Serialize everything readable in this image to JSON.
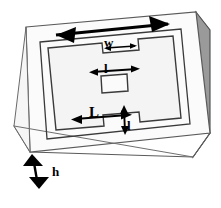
{
  "figure": {
    "kind": "technical-diagram",
    "projection": "oblique-3d",
    "colors": {
      "outline": "#333333",
      "top_face": "#fafafa",
      "front_face": "#ffffff",
      "side_face": "#9a9a9a",
      "slot_fill": "#f2f2f2",
      "arrow": "#000000",
      "label_text": "#000000",
      "background": "#ffffff"
    },
    "dimensions": [
      {
        "id": "w-top-notch",
        "label": "w",
        "arrow": "double-headed-horizontal",
        "location": "top notch of slot ring",
        "describes": "width of the upper notch"
      },
      {
        "id": "l-center-patch",
        "label": "l",
        "arrow": "double-headed-horizontal",
        "location": "above centre square patch",
        "describes": "side length of the centre square"
      },
      {
        "id": "L-bottom-notch",
        "label": "L",
        "arrow": "double-headed-horizontal",
        "location": "bottom notch of slot ring",
        "describes": "length of the lower notch"
      },
      {
        "id": "l-notch-depth",
        "label": "l",
        "arrow": "double-headed-vertical",
        "location": "right of bottom notch",
        "describes": "depth of the lower notch"
      },
      {
        "id": "h-block-height",
        "label": "h",
        "arrow": "double-headed-vertical",
        "location": "front-left face of block",
        "describes": "height / thickness of the substrate block"
      },
      {
        "id": "span-top-edge",
        "label": "",
        "arrow": "double-headed-horizontal",
        "location": "across the top face upper edge",
        "describes": "overall span of the top face (unlabelled)"
      }
    ]
  }
}
